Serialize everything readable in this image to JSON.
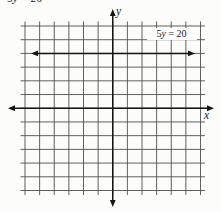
{
  "page": {
    "background": "#fcfcfb"
  },
  "caption": {
    "prefix": "5",
    "variable": "y",
    "suffix": " = 20"
  },
  "figure": {
    "equation_label": {
      "prefix": "5",
      "variable": "y",
      "suffix": " = 20"
    },
    "x_axis_label": "x",
    "y_axis_label": "y",
    "grid": {
      "columns": 12,
      "rows": 12,
      "y_axis_column": 6,
      "x_axis_row": 6,
      "equation_line_units_above_x_axis": 4
    },
    "colors": {
      "grid_line": "#4f4f4f",
      "axis_line": "#161616",
      "equation_line": "#161616",
      "label_box_background": "#ffffff"
    }
  }
}
